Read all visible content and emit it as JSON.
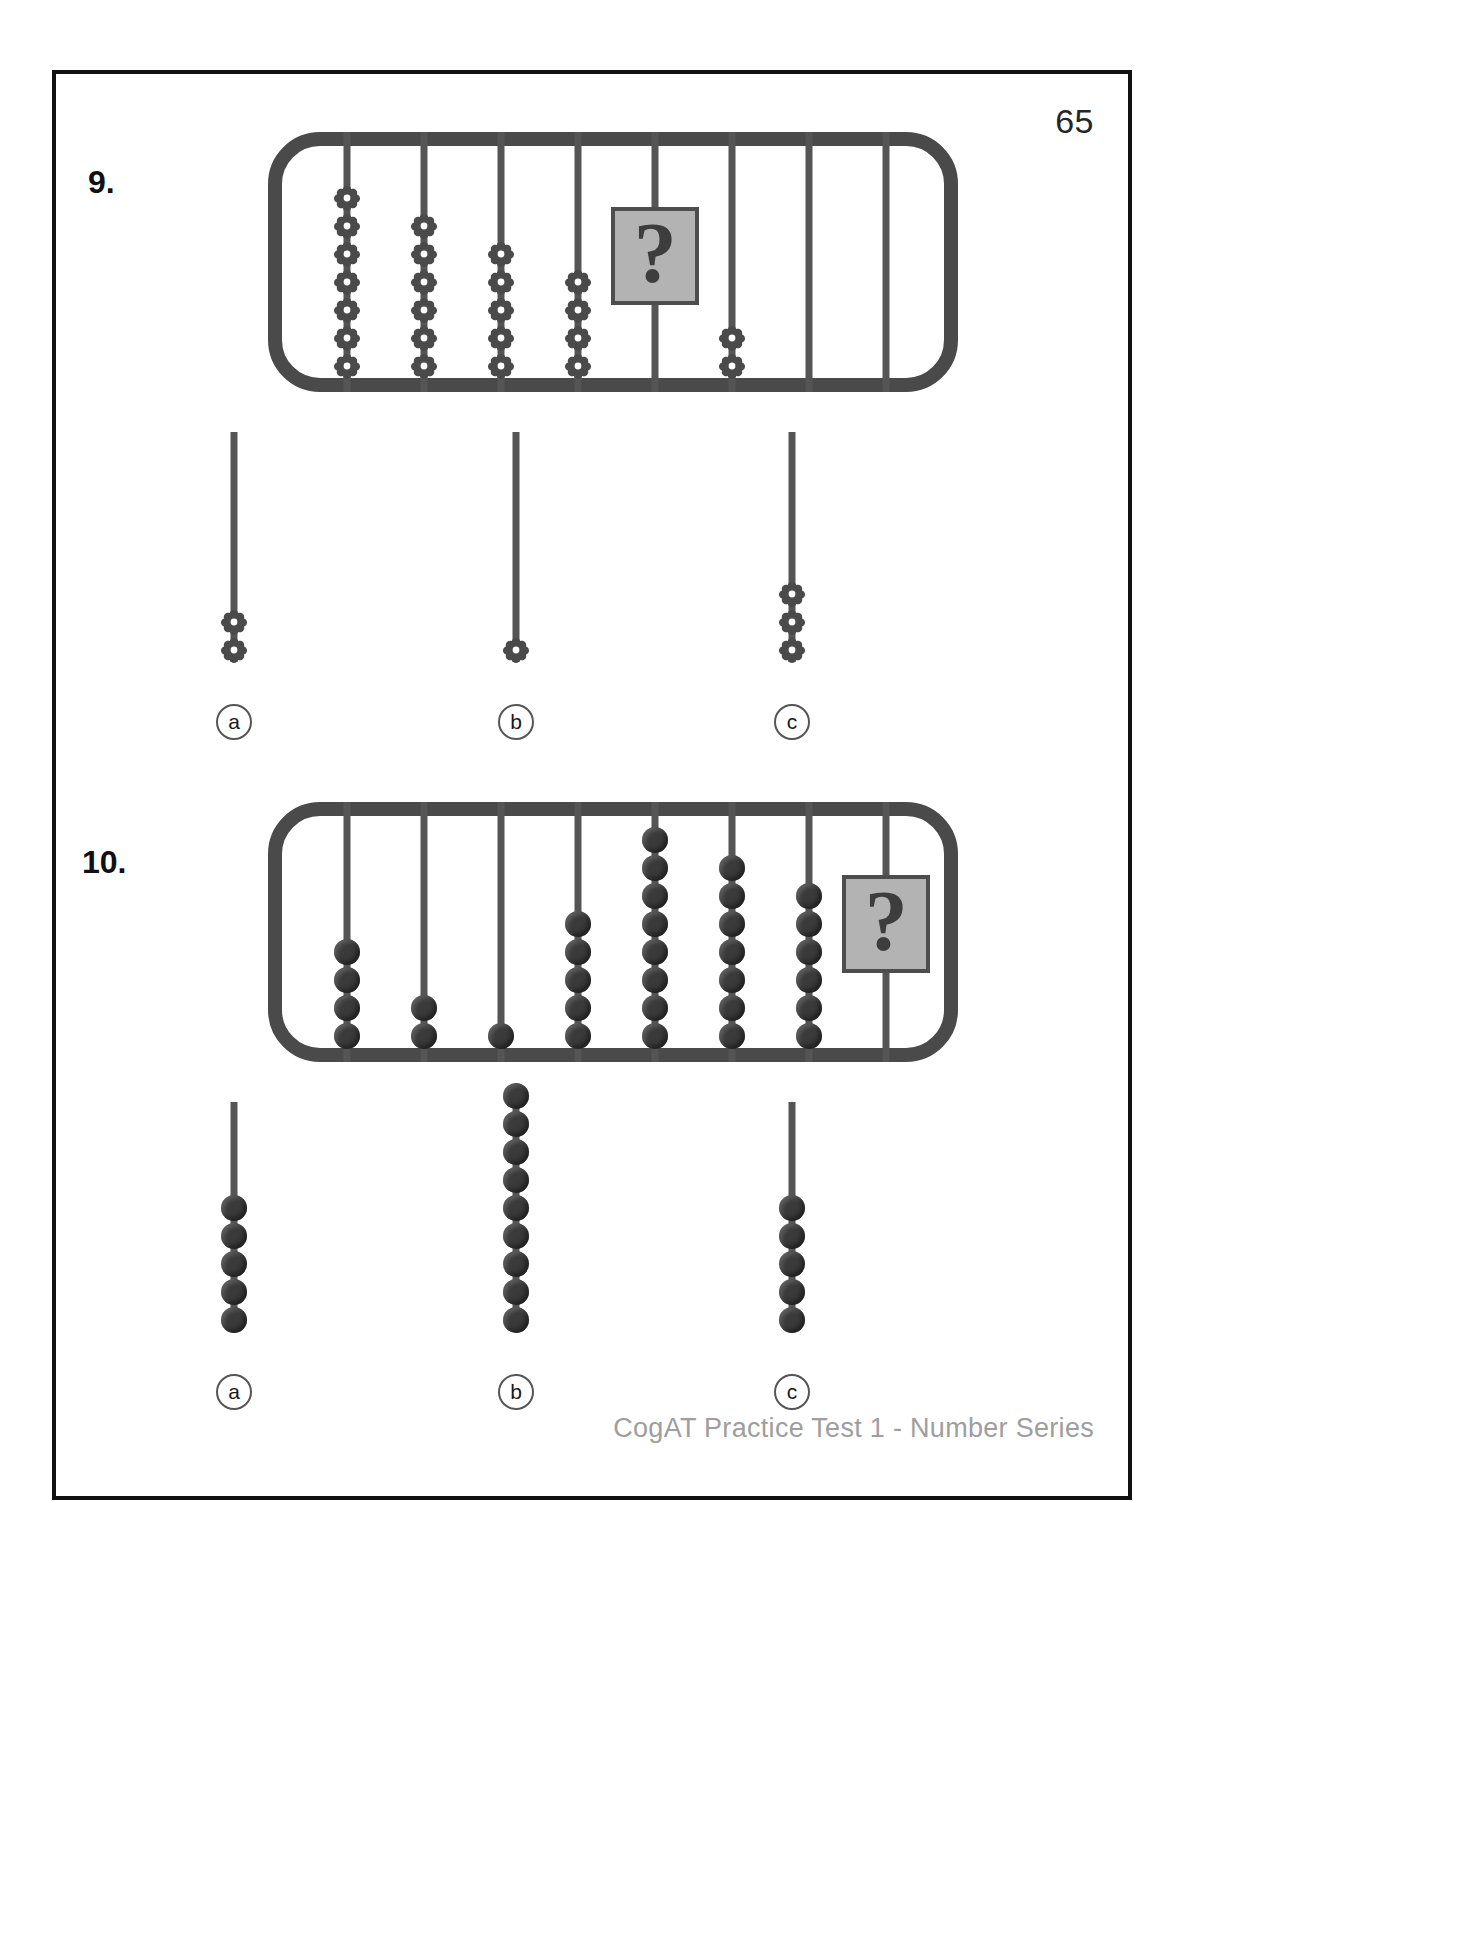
{
  "page": {
    "number": "65",
    "footer": "CogAT Practice Test 1 - Number Series"
  },
  "questions": [
    {
      "id": "q9",
      "number": "9.",
      "bead_style": "flower",
      "question_tile": "?",
      "abacus": {
        "rods": [
          {
            "beads": 7,
            "question": false
          },
          {
            "beads": 6,
            "question": false
          },
          {
            "beads": 5,
            "question": false
          },
          {
            "beads": 4,
            "question": false
          },
          {
            "beads": 0,
            "question": true
          },
          {
            "beads": 2,
            "question": false
          },
          {
            "beads": 0,
            "question": false
          },
          {
            "beads": 0,
            "question": false
          }
        ]
      },
      "options": [
        {
          "label": "a",
          "beads": 2
        },
        {
          "label": "b",
          "beads": 1
        },
        {
          "label": "c",
          "beads": 3
        }
      ]
    },
    {
      "id": "q10",
      "number": "10.",
      "bead_style": "round",
      "question_tile": "?",
      "abacus": {
        "rods": [
          {
            "beads": 4,
            "question": false
          },
          {
            "beads": 2,
            "question": false
          },
          {
            "beads": 1,
            "question": false
          },
          {
            "beads": 5,
            "question": false
          },
          {
            "beads": 8,
            "question": false
          },
          {
            "beads": 7,
            "question": false
          },
          {
            "beads": 6,
            "question": false
          },
          {
            "beads": 0,
            "question": true
          }
        ]
      },
      "options": [
        {
          "label": "a",
          "beads": 5
        },
        {
          "label": "b",
          "beads": 9
        },
        {
          "label": "c",
          "beads": 5
        }
      ]
    }
  ],
  "colors": {
    "frame": "#4a4a4a",
    "rod": "#555555",
    "bead": "#3a3a3a",
    "tile_fill": "#b3b3b3",
    "tile_border": "#4d4d4d",
    "footer_text": "#9e9e9e",
    "ink": "#111111"
  }
}
